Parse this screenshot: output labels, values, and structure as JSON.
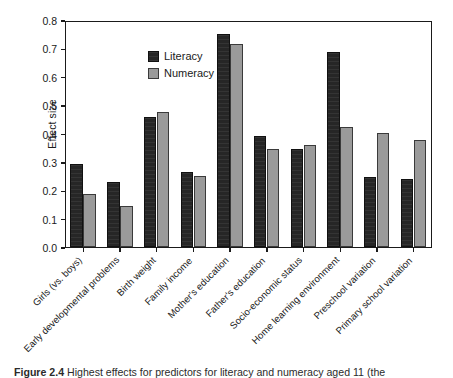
{
  "figure": {
    "caption_label": "Figure 2.4",
    "caption_text": "Highest effects for predictors for literacy and numeracy aged 11 (the"
  },
  "legend": {
    "position": "top-left-inside",
    "entries": [
      {
        "label": "Literacy",
        "color": "#262626",
        "swatch": "literacy-swatch"
      },
      {
        "label": "Numeracy",
        "color": "#9a9a9a",
        "swatch": "numeracy-swatch"
      }
    ]
  },
  "axes": {
    "ylabel": "Effect size",
    "yticks": [
      "0.0",
      "0.1",
      "0.2",
      "0.3",
      "0.4",
      "0.5",
      "0.6",
      "0.7",
      "0.8"
    ],
    "ymin": 0.0,
    "ymax": 0.8
  },
  "chart_data": {
    "type": "bar",
    "title": "",
    "xlabel": "",
    "ylabel": "Effect size",
    "ylim": [
      0.0,
      0.8
    ],
    "grid": false,
    "legend_position": "upper left",
    "categories": [
      "Girls (vs. boys)",
      "Early developmental problems",
      "Birth weight",
      "Family income",
      "Mother's education",
      "Father's education",
      "Socio-economic status",
      "Home learning environment",
      "Preschool variation",
      "Primary school variation"
    ],
    "series": [
      {
        "name": "Literacy",
        "color": "#262626",
        "values": [
          0.293,
          0.228,
          0.458,
          0.263,
          0.75,
          0.39,
          0.345,
          0.686,
          0.248,
          0.238
        ]
      },
      {
        "name": "Numeracy",
        "color": "#9a9a9a",
        "values": [
          0.186,
          0.144,
          0.477,
          0.251,
          0.714,
          0.344,
          0.359,
          0.424,
          0.403,
          0.377
        ]
      }
    ],
    "ytick_values": [
      0.0,
      0.1,
      0.2,
      0.3,
      0.4,
      0.5,
      0.6,
      0.7,
      0.8
    ]
  }
}
